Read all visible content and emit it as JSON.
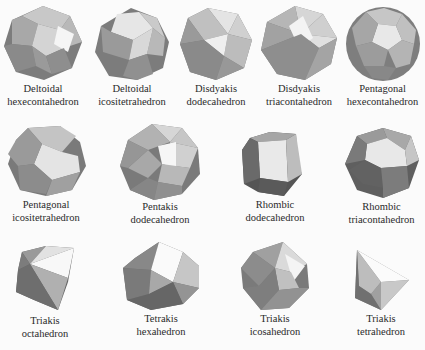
{
  "rows": [
    [
      {
        "line1": "Deltoidal",
        "line2": "hexecontahedron",
        "shape": "deltoidal-hexecontahedron"
      },
      {
        "line1": "Deltoidal",
        "line2": "icositetrahedron",
        "shape": "deltoidal-icositetrahedron"
      },
      {
        "line1": "Disdyakis",
        "line2": "dodecahedron",
        "shape": "disdyakis-dodecahedron"
      },
      {
        "line1": "Disdyakis",
        "line2": "triacontahedron",
        "shape": "disdyakis-triacontahedron"
      },
      {
        "line1": "Pentagonal",
        "line2": "hexecontahedron",
        "shape": "pentagonal-hexecontahedron"
      }
    ],
    [
      {
        "line1": "Pentagonal",
        "line2": "icositetrahedron",
        "shape": "pentagonal-icositetrahedron"
      },
      {
        "line1": "Pentakis",
        "line2": "dodecahedron",
        "shape": "pentakis-dodecahedron"
      },
      {
        "line1": "Rhombic",
        "line2": "dodecahedron",
        "shape": "rhombic-dodecahedron"
      },
      {
        "line1": "Rhombic",
        "line2": "triacontahedron",
        "shape": "rhombic-triacontahedron"
      }
    ],
    [
      {
        "line1": "Triakis",
        "line2": "octahedron",
        "shape": "triakis-octahedron"
      },
      {
        "line1": "Tetrakis",
        "line2": "hexahedron",
        "shape": "tetrakis-hexahedron"
      },
      {
        "line1": "Triakis",
        "line2": "icosahedron",
        "shape": "triakis-icosahedron"
      },
      {
        "line1": "Triakis",
        "line2": "tetrahedron",
        "shape": "triakis-tetrahedron"
      }
    ]
  ],
  "colors": {
    "light": "#e8e8e8",
    "mid": "#b4b4b4",
    "dark": "#7c7c7c",
    "darker": "#5e5e5e",
    "highlight": "#f7f7f7"
  }
}
